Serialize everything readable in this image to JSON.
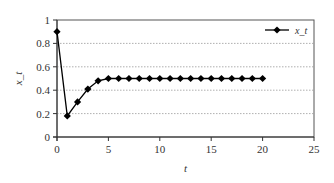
{
  "chart_data": {
    "type": "line",
    "title": "",
    "xlabel": "t",
    "ylabel": "x_t",
    "xlim": [
      0,
      25
    ],
    "ylim": [
      0,
      1
    ],
    "xticks": [
      0,
      5,
      10,
      15,
      20,
      25
    ],
    "yticks": [
      0,
      0.2,
      0.4,
      0.6,
      0.8,
      1
    ],
    "xtick_labels": [
      "0",
      "5",
      "10",
      "15",
      "20",
      "25"
    ],
    "ytick_labels": [
      "0",
      "0.2",
      "0.4",
      "0.6",
      "0.8",
      "1"
    ],
    "grid": {
      "y": true,
      "x": false,
      "style": "dotted"
    },
    "legend_position": "upper right",
    "series": [
      {
        "name": "x_t",
        "marker": "diamond",
        "color": "#000000",
        "x": [
          0,
          1,
          2,
          3,
          4,
          5,
          6,
          7,
          8,
          9,
          10,
          11,
          12,
          13,
          14,
          15,
          16,
          17,
          18,
          19,
          20
        ],
        "values": [
          0.9,
          0.18,
          0.3,
          0.41,
          0.48,
          0.5,
          0.5,
          0.5,
          0.5,
          0.5,
          0.5,
          0.5,
          0.5,
          0.5,
          0.5,
          0.5,
          0.5,
          0.5,
          0.5,
          0.5,
          0.5
        ]
      }
    ]
  },
  "legend": {
    "label": "x_t"
  },
  "axes": {
    "xlabel": "t",
    "ylabel": "x_t"
  },
  "colors": {
    "line": "#000000",
    "grid": "#9a9a9a",
    "frame": "#555555"
  }
}
